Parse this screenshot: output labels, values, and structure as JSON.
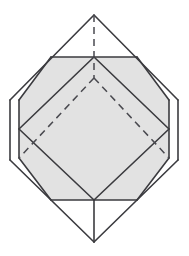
{
  "figure": {
    "title": "Octahedron inscribed in a hexagonal prism with shaded hexagonal cross-section",
    "canvas": {
      "width": 189,
      "height": 256
    },
    "colors": {
      "background": "#ffffff",
      "stroke": "#3b3b3f",
      "stroke_light": "#55555a",
      "shaded_fill": "#e2e2e2",
      "dashed_stroke": "#4a4a50"
    },
    "stroke_widths": {
      "solid": 1.6,
      "solid_thin": 1.2,
      "dashed": 1.5
    },
    "dash_pattern": "7,5",
    "vertices": {
      "top_apex": {
        "x": 94,
        "y": 15
      },
      "bottom_apex": {
        "x": 94,
        "y": 242
      },
      "left_upper": {
        "x": 10,
        "y": 100
      },
      "left_lower": {
        "x": 10,
        "y": 160
      },
      "right_upper": {
        "x": 178,
        "y": 100
      },
      "right_lower": {
        "x": 178,
        "y": 160
      },
      "hex_top_left": {
        "x": 51,
        "y": 57
      },
      "hex_top_right": {
        "x": 137,
        "y": 57
      },
      "hex_mid_left": {
        "x": 19,
        "y": 100
      },
      "hex_mid_right": {
        "x": 169,
        "y": 100
      },
      "hex_low_left": {
        "x": 19,
        "y": 158
      },
      "hex_low_right": {
        "x": 169,
        "y": 158
      },
      "hex_bot_left": {
        "x": 51,
        "y": 200
      },
      "hex_bot_right": {
        "x": 137,
        "y": 200
      },
      "diamond_left": {
        "x": 19,
        "y": 129
      },
      "diamond_right": {
        "x": 169,
        "y": 129
      },
      "diamond_top": {
        "x": 94,
        "y": 57
      },
      "diamond_bottom": {
        "x": 94,
        "y": 200
      },
      "hidden_center": {
        "x": 94,
        "y": 78
      }
    },
    "shaded_polygon": [
      {
        "x": 51,
        "y": 57
      },
      {
        "x": 137,
        "y": 57
      },
      {
        "x": 169,
        "y": 100
      },
      {
        "x": 169,
        "y": 158
      },
      {
        "x": 137,
        "y": 200
      },
      {
        "x": 51,
        "y": 200
      },
      {
        "x": 19,
        "y": 158
      },
      {
        "x": 19,
        "y": 100
      }
    ],
    "solid_edges": [
      {
        "name": "apex-to-left-upper",
        "x1": 94,
        "y1": 15,
        "x2": 10,
        "y2": 100
      },
      {
        "name": "apex-to-right-upper",
        "x1": 94,
        "y1": 15,
        "x2": 178,
        "y2": 100
      },
      {
        "name": "left-vertical",
        "x1": 10,
        "y1": 100,
        "x2": 10,
        "y2": 160
      },
      {
        "name": "right-vertical",
        "x1": 178,
        "y1": 100,
        "x2": 178,
        "y2": 160
      },
      {
        "name": "left-lower-to-bottom",
        "x1": 10,
        "y1": 160,
        "x2": 94,
        "y2": 242
      },
      {
        "name": "right-lower-to-bottom",
        "x1": 178,
        "y1": 160,
        "x2": 94,
        "y2": 242
      },
      {
        "name": "hex-top-edge",
        "x1": 51,
        "y1": 57,
        "x2": 137,
        "y2": 57
      },
      {
        "name": "hex-bottom-edge",
        "x1": 51,
        "y1": 200,
        "x2": 137,
        "y2": 200
      },
      {
        "name": "hex-upper-left-edge",
        "x1": 51,
        "y1": 57,
        "x2": 19,
        "y2": 100
      },
      {
        "name": "hex-left-edge",
        "x1": 19,
        "y1": 100,
        "x2": 19,
        "y2": 158
      },
      {
        "name": "hex-lower-left-edge",
        "x1": 19,
        "y1": 158,
        "x2": 51,
        "y2": 200
      },
      {
        "name": "hex-upper-right-edge",
        "x1": 137,
        "y1": 57,
        "x2": 169,
        "y2": 100
      },
      {
        "name": "hex-right-edge",
        "x1": 169,
        "y1": 100,
        "x2": 169,
        "y2": 158
      },
      {
        "name": "hex-lower-right-edge",
        "x1": 169,
        "y1": 158,
        "x2": 137,
        "y2": 200
      },
      {
        "name": "diamond-top-left",
        "x1": 94,
        "y1": 57,
        "x2": 19,
        "y2": 129
      },
      {
        "name": "diamond-top-right",
        "x1": 94,
        "y1": 57,
        "x2": 169,
        "y2": 129
      },
      {
        "name": "diamond-bottom-left",
        "x1": 19,
        "y1": 129,
        "x2": 94,
        "y2": 200
      },
      {
        "name": "diamond-bottom-right",
        "x1": 169,
        "y1": 129,
        "x2": 94,
        "y2": 200
      },
      {
        "name": "center-vertical-lower",
        "x1": 94,
        "y1": 200,
        "x2": 94,
        "y2": 242
      }
    ],
    "dashed_edges": [
      {
        "name": "hidden-vertical-axis",
        "x1": 94,
        "y1": 15,
        "x2": 94,
        "y2": 78
      },
      {
        "name": "hidden-edge-left",
        "x1": 94,
        "y1": 78,
        "x2": 19,
        "y2": 158
      },
      {
        "name": "hidden-edge-right",
        "x1": 94,
        "y1": 78,
        "x2": 169,
        "y2": 158
      }
    ]
  }
}
